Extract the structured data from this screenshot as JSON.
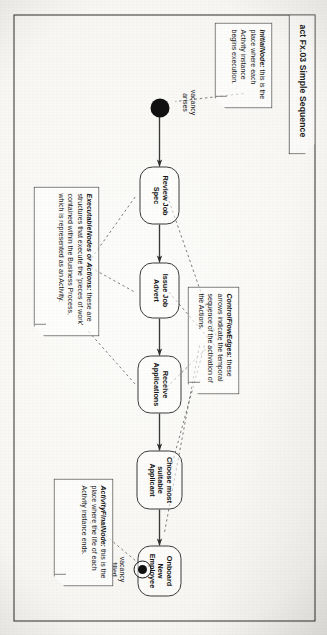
{
  "frame": {
    "title": "act Fx.03 Simple Sequence"
  },
  "diagram": {
    "type": "uml-activity-diagram",
    "initial_node_name": "initial-node",
    "final_node_name": "activity-final-node"
  },
  "actions": [
    {
      "id": "review-job-spec",
      "label": "Review Job\nSpec"
    },
    {
      "id": "issue-job-advert",
      "label": "Issue Job\nAdvert"
    },
    {
      "id": "receive-applications",
      "label": "Receive\nApplications"
    },
    {
      "id": "choose-most-suitable-applicant",
      "label": "Choose most\nsuitable\nApplicant"
    },
    {
      "id": "onboard-new-employee",
      "label": "Onboard\nNew\nEmployee"
    }
  ],
  "edge_labels": {
    "start": "vacancy\narises",
    "end": "vacancy\nfilled"
  },
  "notes": [
    {
      "id": "note-initial-node",
      "title": "InitialNode:",
      "body": " this is the place where each Activity instance begins execution."
    },
    {
      "id": "note-executable-nodes",
      "title": "ExecutableNodes or Actions:",
      "body": " these are structures that execute the 'pieces of work' contained within the Business Process, which is represented as an Activity."
    },
    {
      "id": "note-control-flow-edges",
      "title": "ControlFlowEdges:",
      "body": " these arrows indicate the temporal sequence of the activation of the Actions."
    },
    {
      "id": "note-activity-final-node",
      "title": "ActivityFinalNode:",
      "body": " this is the place where the life of each Activity instance ends."
    }
  ],
  "colors": {
    "ink": "#151515",
    "line": "#3a3a3a",
    "paper": "#f7f6f3"
  }
}
